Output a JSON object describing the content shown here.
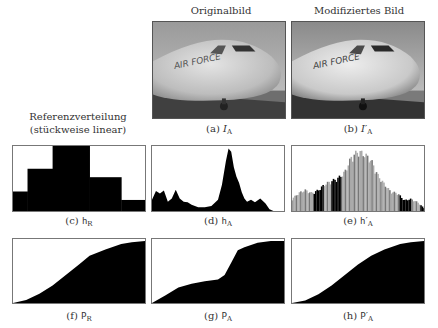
{
  "header": {
    "col_original": "Originalbild",
    "col_modified": "Modifiziertes Bild",
    "reference_line1": "Referenzverteilung",
    "reference_line2": "(stückweise linear)"
  },
  "captions": {
    "a": {
      "prefix": "(a)",
      "sym": "I",
      "sub": "A",
      "prime": ""
    },
    "b": {
      "prefix": "(b)",
      "sym": "I",
      "sub": "A",
      "prime": "′"
    },
    "c": {
      "prefix": "(c)",
      "sym": "h",
      "sub": "R",
      "prime": ""
    },
    "d": {
      "prefix": "(d)",
      "sym": "h",
      "sub": "A",
      "prime": ""
    },
    "e": {
      "prefix": "(e)",
      "sym": "h",
      "sub": "A",
      "prime": "′"
    },
    "f": {
      "prefix": "(f)",
      "sym": "P",
      "sub": "R",
      "prime": ""
    },
    "g": {
      "prefix": "(g)",
      "sym": "P",
      "sub": "A",
      "prime": ""
    },
    "h": {
      "prefix": "(h)",
      "sym": "P",
      "sub": "A",
      "prime": "′"
    }
  },
  "photo": {
    "fuselage_text": "AIR FORCE"
  },
  "chart_data": [
    {
      "id": "c",
      "type": "bar",
      "title": "h_R (Referenzverteilung, stückweise linear)",
      "x": [
        0,
        0.11,
        0.3,
        0.58,
        0.82,
        1.0
      ],
      "values": [
        0.3,
        0.65,
        1.0,
        0.52,
        0.17
      ],
      "xlabel": "",
      "ylabel": "",
      "ylim": [
        0,
        1
      ],
      "grid": false
    },
    {
      "id": "d",
      "type": "area",
      "title": "h_A",
      "x": [
        0,
        0.03,
        0.06,
        0.09,
        0.12,
        0.15,
        0.18,
        0.21,
        0.24,
        0.27,
        0.3,
        0.35,
        0.4,
        0.45,
        0.5,
        0.53,
        0.56,
        0.58,
        0.6,
        0.62,
        0.64,
        0.66,
        0.68,
        0.7,
        0.72,
        0.75,
        0.78,
        0.82,
        0.86,
        0.89,
        0.92,
        0.95,
        1.0
      ],
      "values": [
        0.18,
        0.32,
        0.28,
        0.33,
        0.15,
        0.2,
        0.34,
        0.2,
        0.15,
        0.14,
        0.1,
        0.06,
        0.06,
        0.08,
        0.18,
        0.42,
        0.8,
        1.0,
        0.95,
        0.7,
        0.55,
        0.45,
        0.3,
        0.2,
        0.15,
        0.18,
        0.14,
        0.2,
        0.12,
        0.03,
        0,
        0,
        0
      ],
      "ylim": [
        0,
        1
      ]
    },
    {
      "id": "e",
      "type": "bar",
      "title": "h'_A",
      "note": "comb-like histogram of modified image, shape follows h_R",
      "x": [
        0,
        0.05,
        0.1,
        0.15,
        0.2,
        0.25,
        0.3,
        0.35,
        0.4,
        0.45,
        0.5,
        0.55,
        0.6,
        0.65,
        0.7,
        0.75,
        0.8,
        0.85,
        0.9,
        0.95,
        1.0
      ],
      "values": [
        0.2,
        0.3,
        0.35,
        0.3,
        0.35,
        0.45,
        0.5,
        0.55,
        0.65,
        0.9,
        1.0,
        0.95,
        0.85,
        0.6,
        0.45,
        0.32,
        0.3,
        0.18,
        0.2,
        0.15,
        0.05
      ],
      "ylim": [
        0,
        1
      ]
    },
    {
      "id": "f",
      "type": "area",
      "title": "P_R",
      "x": [
        0,
        0.1,
        0.2,
        0.3,
        0.4,
        0.5,
        0.58,
        0.7,
        0.82,
        0.9,
        1.0
      ],
      "values": [
        0,
        0.05,
        0.15,
        0.28,
        0.45,
        0.62,
        0.76,
        0.86,
        0.95,
        0.98,
        1.0
      ],
      "ylim": [
        0,
        1
      ]
    },
    {
      "id": "g",
      "type": "area",
      "title": "P_A",
      "x": [
        0,
        0.1,
        0.2,
        0.3,
        0.4,
        0.5,
        0.55,
        0.6,
        0.65,
        0.7,
        0.8,
        0.9,
        1.0
      ],
      "values": [
        0,
        0.12,
        0.25,
        0.31,
        0.35,
        0.38,
        0.45,
        0.65,
        0.85,
        0.9,
        0.97,
        1.0,
        1.0
      ],
      "ylim": [
        0,
        1
      ]
    },
    {
      "id": "h",
      "type": "area",
      "title": "P'_A",
      "x": [
        0,
        0.1,
        0.2,
        0.3,
        0.4,
        0.5,
        0.6,
        0.7,
        0.82,
        0.9,
        1.0
      ],
      "values": [
        0,
        0.04,
        0.14,
        0.28,
        0.45,
        0.62,
        0.76,
        0.86,
        0.95,
        0.98,
        1.0
      ],
      "ylim": [
        0,
        1
      ]
    }
  ]
}
